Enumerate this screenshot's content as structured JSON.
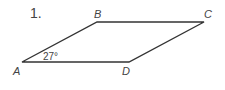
{
  "problem": {
    "number": "1."
  },
  "figure": {
    "shape": "parallelogram",
    "vertices": [
      {
        "label": "A",
        "x": 22,
        "y": 62
      },
      {
        "label": "B",
        "x": 97,
        "y": 22
      },
      {
        "label": "C",
        "x": 204,
        "y": 22
      },
      {
        "label": "D",
        "x": 129,
        "y": 62
      }
    ],
    "angle_label": "27°",
    "stroke_color": "#333333"
  }
}
